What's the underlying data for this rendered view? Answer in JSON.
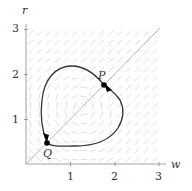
{
  "figure": {
    "x_axis_label": "w",
    "y_axis_label": "r",
    "x_ticks": [
      "1",
      "2",
      "3"
    ],
    "y_ticks": [
      "1",
      "2",
      "3"
    ],
    "point_labels": {
      "P": "P",
      "Q": "Q"
    },
    "colors": {
      "axis": "#888888",
      "curve": "#333333",
      "field": "#d0d0d0",
      "diagonal": "#aaaaaa",
      "point": "#000000"
    }
  },
  "chart_data": {
    "type": "phase-portrait",
    "title": "",
    "xlabel": "w",
    "ylabel": "r",
    "xlim": [
      0,
      3
    ],
    "ylim": [
      0,
      3
    ],
    "x_ticks": [
      1,
      2,
      3
    ],
    "y_ticks": [
      1,
      2,
      3
    ],
    "diagonal": {
      "from": [
        0,
        0
      ],
      "to": [
        3,
        3
      ]
    },
    "closed_orbit": [
      [
        1.75,
        1.8
      ],
      [
        1.5,
        1.98
      ],
      [
        1.1,
        2.1
      ],
      [
        0.8,
        2.05
      ],
      [
        0.5,
        1.75
      ],
      [
        0.38,
        1.3
      ],
      [
        0.4,
        0.85
      ],
      [
        0.48,
        0.5
      ],
      [
        0.7,
        0.42
      ],
      [
        1.1,
        0.42
      ],
      [
        1.6,
        0.55
      ],
      [
        2.05,
        0.95
      ],
      [
        2.15,
        1.25
      ],
      [
        2.0,
        1.6
      ],
      [
        1.75,
        1.8
      ]
    ],
    "points": [
      {
        "name": "P",
        "w": 1.75,
        "r": 1.77,
        "arrow": "down-right"
      },
      {
        "name": "Q",
        "w": 0.47,
        "r": 0.47,
        "arrow": "down"
      }
    ],
    "vector_field": {
      "x_range": [
        0,
        3
      ],
      "y_range": [
        0,
        3
      ],
      "grid_step": 0.2,
      "style": "light gray dashes"
    }
  }
}
